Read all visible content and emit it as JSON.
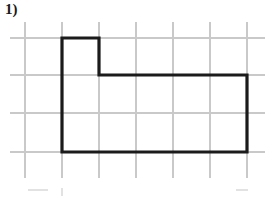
{
  "page": {
    "width": 268,
    "height": 201,
    "background_color": "#ffffff"
  },
  "problem": {
    "number_label": "1)"
  },
  "grid": {
    "line_color": "#c9c9c9",
    "faint_line_color": "#e2e2e2",
    "spacing_x": 37,
    "spacing_y": 38,
    "vertical_line_x": [
      25,
      62,
      99,
      136,
      173,
      210,
      247
    ],
    "vertical_line_top": 22,
    "vertical_line_bottom": 178,
    "horizontal_line_y": [
      38,
      75,
      113,
      152
    ],
    "horizontal_line_left": 10,
    "horizontal_line_right": 265,
    "partial_bottom_row_y": 190
  },
  "figure": {
    "name": "l-shaped-polygon",
    "stroke_color": "#1b1b1b",
    "stroke_width": 3.2,
    "vertices": [
      [
        62,
        38
      ],
      [
        99,
        38
      ],
      [
        99,
        75
      ],
      [
        247,
        75
      ],
      [
        247,
        152
      ],
      [
        62,
        152
      ]
    ],
    "path": "M 62 38 L 99 38 L 99 75 L 247 75 L 247 152 L 62 152 Z",
    "grid_units": {
      "total_width_units": 5,
      "total_height_units": 3,
      "notch_width_units": 1,
      "notch_height_units": 1
    }
  }
}
